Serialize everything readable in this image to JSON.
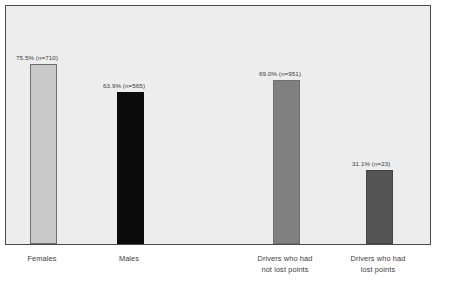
{
  "chart_data": {
    "type": "bar",
    "title": "",
    "subtitle": "",
    "xlabel": "",
    "ylabel": "",
    "ylim": [
      0,
      100
    ],
    "grid": false,
    "legend": "none",
    "categories": [
      "Females",
      "Males",
      "Drivers who had\nnot lost points",
      "Drivers who had\nlost points"
    ],
    "values": [
      75.5,
      63.9,
      69.0,
      31.1
    ],
    "counts": [
      710,
      565,
      951,
      23
    ],
    "data_labels": [
      "75.5% (n=710)",
      "63.9% (n=565)",
      "69.0% (n=951)",
      "31.1% (n=23)"
    ],
    "bar_colors": [
      "#c9c9c9",
      "#0b0b0b",
      "#808080",
      "#545454"
    ],
    "bar_border_colors": [
      "#6e6e6e",
      "#0b0b0b",
      "#6e6e6e",
      "#454545"
    ]
  },
  "figure": {
    "background_color": "#ffffff",
    "plot_background_color": "#ededed",
    "plot_border_color": "#4a4a4a",
    "label_color": "#3c3c3c"
  }
}
